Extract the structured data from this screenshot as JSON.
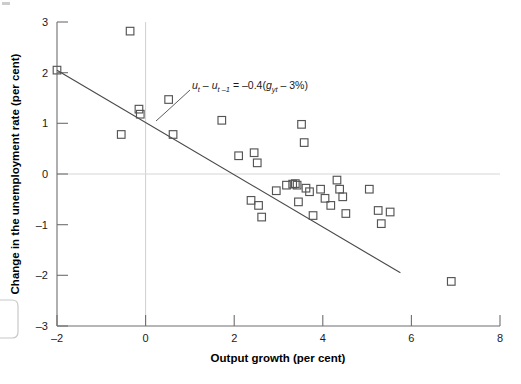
{
  "chart_data": {
    "type": "scatter",
    "title": "",
    "xlabel": "Output growth (per cent)",
    "ylabel": "Change in the unemployment rate (per cent)",
    "xlim": [
      -2,
      8
    ],
    "ylim": [
      -3,
      3
    ],
    "xticks": [
      -2,
      0,
      2,
      4,
      6,
      8
    ],
    "yticks": [
      3,
      2,
      1,
      0,
      -1,
      -2,
      -3
    ],
    "xticklabels": [
      "–2",
      "0",
      "2",
      "4",
      "6",
      "8"
    ],
    "yticklabels": [
      "3",
      "2",
      "1",
      "0",
      "–1",
      "–2",
      "–3"
    ],
    "grid": "vertical gridline at x=0; horizontal reference line at y=0",
    "legend": "none",
    "marker": "open square",
    "marker_color": "#555555",
    "annotations": [
      {
        "name": "okun-law-equation",
        "text": "uₜ – uₜ₋₁ = –0.4(gᵧₜ – 3%)",
        "parts": {
          "lhs_var": "u",
          "lhs_sub1": "t",
          "lhs_sub2": "t –1",
          "coefficient": "–0.4",
          "growth_var": "g",
          "growth_sub": "yt",
          "normal_growth": "3%"
        },
        "x": 2.1,
        "y": 1.62,
        "leader_to": {
          "x": 0.75,
          "y": 0.92
        }
      }
    ],
    "fit_line": {
      "name": "okun-regression-line",
      "slope": -0.4,
      "intercept": 1.2,
      "x_start": -2.0,
      "y_start": 2.05,
      "x_end": 7.75,
      "y_end": -1.95
    },
    "points": [
      {
        "x": -2.0,
        "y": 2.05
      },
      {
        "x": -0.55,
        "y": 0.78
      },
      {
        "x": -0.35,
        "y": 2.82
      },
      {
        "x": -0.15,
        "y": 1.28
      },
      {
        "x": -0.12,
        "y": 1.18
      },
      {
        "x": 0.52,
        "y": 1.47
      },
      {
        "x": 0.62,
        "y": 0.78
      },
      {
        "x": 1.72,
        "y": 1.06
      },
      {
        "x": 2.1,
        "y": 0.36
      },
      {
        "x": 2.38,
        "y": -0.52
      },
      {
        "x": 2.45,
        "y": 0.42
      },
      {
        "x": 2.52,
        "y": 0.22
      },
      {
        "x": 2.55,
        "y": -0.62
      },
      {
        "x": 2.62,
        "y": -0.85
      },
      {
        "x": 2.95,
        "y": -0.33
      },
      {
        "x": 3.18,
        "y": -0.22
      },
      {
        "x": 3.32,
        "y": -0.2
      },
      {
        "x": 3.38,
        "y": -0.19
      },
      {
        "x": 3.42,
        "y": -0.22
      },
      {
        "x": 3.45,
        "y": -0.55
      },
      {
        "x": 3.52,
        "y": 0.98
      },
      {
        "x": 3.58,
        "y": 0.62
      },
      {
        "x": 3.62,
        "y": -0.28
      },
      {
        "x": 3.7,
        "y": -0.35
      },
      {
        "x": 3.78,
        "y": -0.82
      },
      {
        "x": 3.95,
        "y": -0.3
      },
      {
        "x": 4.05,
        "y": -0.48
      },
      {
        "x": 4.18,
        "y": -0.62
      },
      {
        "x": 4.32,
        "y": -0.12
      },
      {
        "x": 4.38,
        "y": -0.3
      },
      {
        "x": 4.45,
        "y": -0.45
      },
      {
        "x": 4.52,
        "y": -0.78
      },
      {
        "x": 5.05,
        "y": -0.3
      },
      {
        "x": 5.25,
        "y": -0.72
      },
      {
        "x": 5.32,
        "y": -0.98
      },
      {
        "x": 5.52,
        "y": -0.75
      },
      {
        "x": 6.9,
        "y": -2.12
      }
    ]
  }
}
